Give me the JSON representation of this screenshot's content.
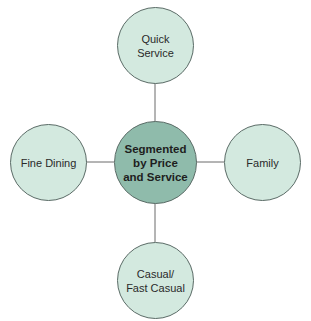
{
  "diagram": {
    "type": "hub-and-spoke",
    "center": {
      "label": "Segmented\nby Price\nand Service"
    },
    "nodes": {
      "top": {
        "label": "Quick\nService"
      },
      "left": {
        "label": "Fine Dining"
      },
      "right": {
        "label": "Family"
      },
      "bottom": {
        "label": "Casual/\nFast Casual"
      }
    },
    "colors": {
      "center_fill": "#8fbbab",
      "outer_fill": "#d3e9df",
      "stroke": "#5a6b66"
    }
  }
}
